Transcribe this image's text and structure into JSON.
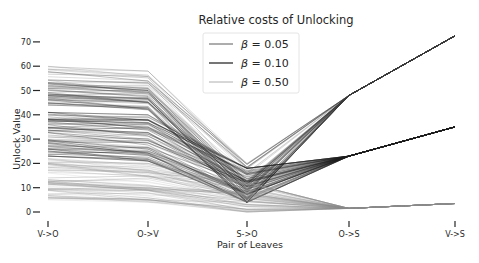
{
  "chart_data": {
    "type": "line",
    "subtype": "parallel-coordinates",
    "title": "Relative costs of Unlocking",
    "xlabel": "Pair of Leaves",
    "ylabel": "Unlock Value",
    "categories": [
      "V->O",
      "O->V",
      "S->O",
      "O->S",
      "V->S"
    ],
    "yticks": [
      0,
      10,
      20,
      30,
      40,
      50,
      60,
      70
    ],
    "ylim": [
      -1,
      75
    ],
    "grid": false,
    "legend_position": "upper center",
    "legend": [
      {
        "label": "β =  0.05",
        "symbol": "β",
        "value": "0.05",
        "color": "#5a5a5a",
        "width": 1.0
      },
      {
        "label": "β =  0.10",
        "symbol": "β",
        "value": "0.10",
        "color": "#2a2a2a",
        "width": 1.3
      },
      {
        "label": "β =  0.50",
        "symbol": "β",
        "value": "0.50",
        "color": "#9a9a9a",
        "width": 0.8
      }
    ],
    "series": [
      {
        "name": "β = 0.50",
        "description": "upper band",
        "color": "#3a3a3a",
        "ranges": {
          "V->O": [
            44,
            60
          ],
          "O->V": [
            42,
            58
          ],
          "S->O": [
            4,
            20
          ],
          "O->S": [
            48,
            48
          ],
          "V->S": [
            72.5,
            72.5
          ]
        },
        "count": 60
      },
      {
        "name": "β = 0.10",
        "description": "middle band",
        "color": "#1e1e1e",
        "ranges": {
          "V->O": [
            23,
            41
          ],
          "O->V": [
            21,
            40
          ],
          "S->O": [
            4,
            18
          ],
          "O->S": [
            23,
            23
          ],
          "V->S": [
            35,
            35
          ]
        },
        "count": 70
      },
      {
        "name": "β = 0.05",
        "description": "lower band",
        "color": "#8a8a8a",
        "ranges": {
          "V->O": [
            5,
            22
          ],
          "O->V": [
            4,
            20
          ],
          "S->O": [
            0,
            12
          ],
          "O->S": [
            1.5,
            1.5
          ],
          "V->S": [
            3.5,
            3.5
          ]
        },
        "count": 60
      }
    ]
  }
}
